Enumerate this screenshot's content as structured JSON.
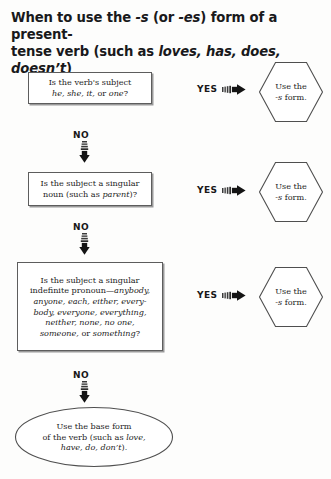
{
  "title": {
    "line1_a": "When to use the ",
    "line1_b": "-s",
    "line1_c": " (or ",
    "line1_d": "-es",
    "line1_e": ") form of a present-",
    "line2_a": "tense verb (such as ",
    "line2_b": "loves, has, does, doesn’t",
    "line2_c": ")"
  },
  "steps": [
    {
      "question_line1": "Is the verb's subject",
      "question_line2_italic": "he, she, it,",
      "question_line2_tail": " or ",
      "question_line2_italic2": "one",
      "question_line2_end": "?",
      "yes_label": "YES",
      "no_label": "NO",
      "result_line1": "Use the",
      "result_line2_italic": "-s",
      "result_line2_tail": " form."
    },
    {
      "question_line1": "Is the subject a singular",
      "question_line2_head": "noun (such as ",
      "question_line2_italic": "parent",
      "question_line2_end": ")?",
      "yes_label": "YES",
      "no_label": "NO",
      "result_line1": "Use the",
      "result_line2_italic": "-s",
      "result_line2_tail": " form."
    },
    {
      "question_line1": "Is the subject a singular",
      "question_line2_head": "indefinite pronoun—",
      "question_line2_italic": "anybody,",
      "question_line3_italic": "anyone, each, either, every-",
      "question_line4_italic": "body, everyone, everything,",
      "question_line5_italic": "neither, none, no one,",
      "question_line6_italic": "someone,",
      "question_line6_tail": " or ",
      "question_line6_italic2": "something",
      "question_line6_end": "?",
      "yes_label": "YES",
      "no_label": "NO",
      "result_line1": "Use the",
      "result_line2_italic": "-s",
      "result_line2_tail": " form."
    }
  ],
  "final": {
    "line1": "Use the base form",
    "line2_head": "of the verb (such as ",
    "line2_italic": "love,",
    "line3_italic": "have, do, don’t",
    "line3_end": ")."
  },
  "colors": {
    "page_background": "#fdfdfc",
    "text": "#232323",
    "title": "#19191b",
    "shape_stroke": "#5d5d5d",
    "shape_fill": "#ffffff",
    "arrow": "#1d1d1d",
    "box_shadow": "#9a9a9a"
  }
}
